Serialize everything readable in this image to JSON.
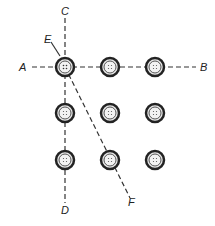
{
  "diagram": {
    "labels": {
      "A": "A",
      "B": "B",
      "C": "C",
      "D": "D",
      "E": "E",
      "F": "F"
    },
    "grid": {
      "columns_x": [
        65,
        110,
        155
      ],
      "rows_y": [
        67,
        113,
        160
      ],
      "button_radius": 9
    },
    "lines": [
      {
        "name": "A-B",
        "from": "A",
        "to": "B",
        "orientation": "horizontal"
      },
      {
        "name": "C-D",
        "from": "C",
        "to": "D",
        "orientation": "vertical"
      },
      {
        "name": "E-F",
        "from": "E",
        "to": "F",
        "orientation": "diagonal"
      }
    ],
    "colors": {
      "line": "#333333",
      "button_ring": "#333333",
      "background": "#ffffff"
    }
  }
}
